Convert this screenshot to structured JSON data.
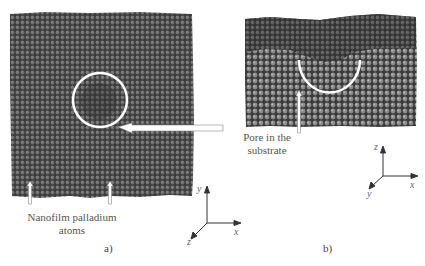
{
  "figure": {
    "panel_a": {
      "label": "a)",
      "annotation": "Nanofilm palladium atoms",
      "annotation_line1": "Nanofilm palladium",
      "annotation_line2": "atoms",
      "axes": {
        "vertical": "y",
        "horizontal": "x",
        "diagonal": "z"
      }
    },
    "panel_b": {
      "label": "b)",
      "annotation_line1": "Pore in the",
      "annotation_line2": "substrate",
      "axes": {
        "vertical": "z",
        "horizontal": "x",
        "diagonal": "y"
      }
    },
    "colors": {
      "atoms_dark": "#3a3a3a",
      "atoms_light": "#8a8a8a",
      "highlight": "#ffffff",
      "text": "#555555"
    }
  }
}
